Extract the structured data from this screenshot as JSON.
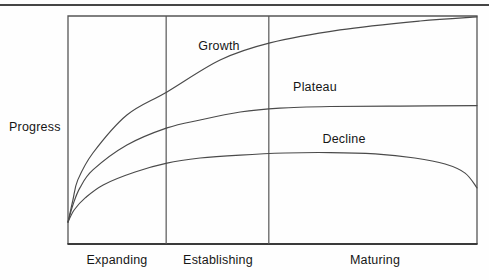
{
  "chart_data": {
    "type": "line",
    "title": "",
    "ylabel": "Progress",
    "xlabel": "",
    "y_axis": {
      "range": [
        0,
        1
      ],
      "ticks": "none",
      "grid": false
    },
    "x_axis": {
      "range": [
        0,
        1
      ],
      "ticks": "none",
      "phases": [
        {
          "label": "Expanding",
          "start": 0,
          "end": 0.24
        },
        {
          "label": "Establishing",
          "start": 0.24,
          "end": 0.491
        },
        {
          "label": "Maturing",
          "start": 0.491,
          "end": 1
        }
      ]
    },
    "phase_dividers": [
      0.24,
      0.491
    ],
    "frame": true,
    "legend": "inline-labels",
    "series": [
      {
        "name": "Growth",
        "points": [
          [
            0,
            0.096
          ],
          [
            0.012,
            0.193
          ],
          [
            0.024,
            0.281
          ],
          [
            0.061,
            0.399
          ],
          [
            0.144,
            0.566
          ],
          [
            0.242,
            0.667
          ],
          [
            0.372,
            0.807
          ],
          [
            0.494,
            0.882
          ],
          [
            0.665,
            0.939
          ],
          [
            0.861,
            0.978
          ],
          [
            1,
            0.996
          ]
        ]
      },
      {
        "name": "Plateau",
        "points": [
          [
            0,
            0.096
          ],
          [
            0.012,
            0.171
          ],
          [
            0.029,
            0.246
          ],
          [
            0.061,
            0.325
          ],
          [
            0.144,
            0.434
          ],
          [
            0.242,
            0.509
          ],
          [
            0.323,
            0.544
          ],
          [
            0.421,
            0.579
          ],
          [
            0.518,
            0.596
          ],
          [
            0.641,
            0.603
          ],
          [
            0.812,
            0.605
          ],
          [
            1,
            0.607
          ]
        ]
      },
      {
        "name": "Decline",
        "points": [
          [
            0,
            0.096
          ],
          [
            0.015,
            0.149
          ],
          [
            0.042,
            0.202
          ],
          [
            0.086,
            0.259
          ],
          [
            0.164,
            0.316
          ],
          [
            0.242,
            0.355
          ],
          [
            0.323,
            0.377
          ],
          [
            0.421,
            0.39
          ],
          [
            0.531,
            0.399
          ],
          [
            0.641,
            0.401
          ],
          [
            0.751,
            0.395
          ],
          [
            0.848,
            0.377
          ],
          [
            0.922,
            0.351
          ],
          [
            0.971,
            0.311
          ],
          [
            1,
            0.246
          ]
        ]
      }
    ]
  },
  "colors": {
    "rule": "#454545",
    "frame": "#565656",
    "bottom_axis": "#3a3a3a",
    "curve": "#4a4a4a",
    "text": "#161616",
    "background": "#fefefe"
  }
}
